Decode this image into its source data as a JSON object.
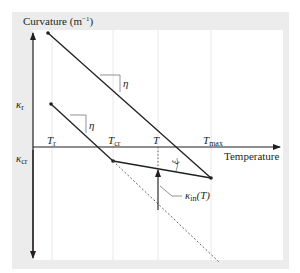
{
  "figure": {
    "y_axis_label": "Curvature (m",
    "y_axis_unit_sup": "−1",
    "y_axis_label_close": ")",
    "x_axis_label": "Temperature",
    "y_ticks": [
      {
        "symbol": "κ",
        "sub": "r"
      },
      {
        "symbol": "κ",
        "sub": "cr"
      }
    ],
    "x_ticks": [
      {
        "symbol": "T",
        "sub": "r"
      },
      {
        "symbol": "T",
        "sub": "cr"
      },
      {
        "symbol": "T",
        "sub": ""
      },
      {
        "symbol": "T",
        "sub": "max"
      }
    ],
    "slope_labels": [
      "η",
      "η"
    ],
    "angle_label": "ξ",
    "callout": {
      "symbol": "κ",
      "sub": "in",
      "arg": "(T)"
    },
    "colors": {
      "line": "#231f20",
      "dashed": "#555555",
      "grid": "#e6e6e6",
      "panel": "#ececec",
      "plot_bg": "#ffffff"
    }
  }
}
